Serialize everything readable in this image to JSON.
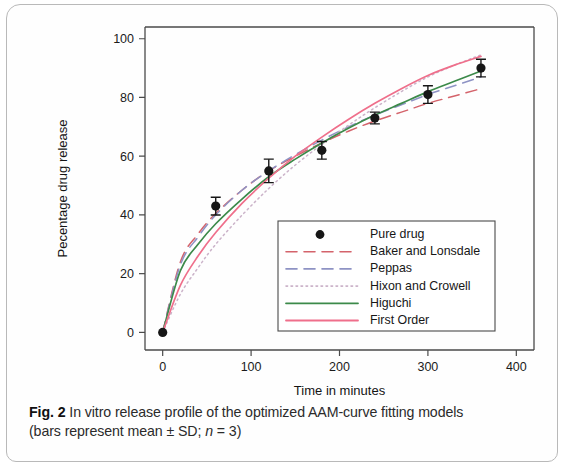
{
  "figure": {
    "caption_label": "Fig. 2",
    "caption_text": " In vitro release profile of the optimized AAM-curve fitting models",
    "caption_line2_a": "(bars represent mean ± SD; ",
    "caption_line2_italic": "n",
    "caption_line2_b": " = 3)"
  },
  "chart_data": {
    "type": "line",
    "title": "",
    "xlabel": "Time in minutes",
    "ylabel": "Pecentage drug release",
    "xlim": [
      -20,
      420
    ],
    "ylim": [
      -6,
      104
    ],
    "xticks": [
      0,
      100,
      200,
      300,
      400
    ],
    "yticks": [
      0,
      20,
      40,
      60,
      80,
      100
    ],
    "xtick_labels": [
      "0",
      "100",
      "200",
      "300",
      "400"
    ],
    "ytick_labels": [
      "0",
      "20",
      "40",
      "60",
      "80",
      "100"
    ],
    "grid": false,
    "legend_position": "lower right",
    "points": {
      "name": "Pure drug",
      "marker": "filled-circle",
      "color": "#161616",
      "x": [
        0,
        60,
        120,
        180,
        240,
        300,
        360
      ],
      "y": [
        0,
        43,
        55,
        62,
        73,
        81,
        90
      ],
      "yerr": [
        0,
        3,
        4,
        3,
        2,
        3,
        3
      ]
    },
    "series": [
      {
        "name": "Baker and Lonsdale",
        "color": "#d4636b",
        "style": "dashed",
        "x": [
          0,
          20,
          40,
          60,
          90,
          120,
          150,
          180,
          210,
          240,
          270,
          300,
          330,
          360
        ],
        "y": [
          0,
          24,
          33.5,
          40.5,
          48.5,
          55,
          60,
          64.5,
          68.5,
          72,
          75,
          78,
          80.5,
          83
        ]
      },
      {
        "name": "Peppas",
        "color": "#8e93c4",
        "style": "dashed",
        "x": [
          0,
          20,
          40,
          60,
          90,
          120,
          150,
          180,
          210,
          240,
          270,
          300,
          330,
          360
        ],
        "y": [
          0,
          23,
          32.5,
          40,
          48.5,
          55,
          60.5,
          65.5,
          70,
          74,
          77.5,
          81,
          84,
          87
        ]
      },
      {
        "name": "Hixon and Crowell",
        "color": "#cbb3c9",
        "style": "dotted",
        "x": [
          0,
          20,
          40,
          60,
          90,
          120,
          150,
          180,
          210,
          240,
          270,
          300,
          330,
          360
        ],
        "y": [
          0,
          13,
          22,
          30,
          40,
          49,
          57,
          64,
          70.5,
          76.5,
          82,
          87,
          91,
          94.5
        ]
      },
      {
        "name": "Higuchi",
        "color": "#3c8a4a",
        "style": "solid",
        "x": [
          0,
          20,
          40,
          60,
          90,
          120,
          150,
          180,
          210,
          240,
          270,
          300,
          330,
          360
        ],
        "y": [
          0,
          21,
          30,
          37,
          45.5,
          53,
          59,
          64.5,
          69.5,
          74,
          78,
          82,
          85.5,
          89
        ]
      },
      {
        "name": "First Order",
        "color": "#ef6f8b",
        "style": "solid",
        "x": [
          0,
          20,
          40,
          60,
          90,
          120,
          150,
          180,
          210,
          240,
          270,
          300,
          330,
          360
        ],
        "y": [
          0,
          16,
          26,
          34,
          44,
          52.5,
          60,
          66.5,
          72.5,
          78,
          83,
          87.5,
          91,
          94
        ]
      }
    ],
    "legend_entries": [
      {
        "label": "Pure drug",
        "kind": "marker",
        "color": "#161616",
        "style": "marker"
      },
      {
        "label": "Baker and Lonsdale",
        "kind": "line",
        "color": "#d4636b",
        "style": "dashed"
      },
      {
        "label": "Peppas",
        "kind": "line",
        "color": "#8e93c4",
        "style": "dashed"
      },
      {
        "label": "Hixon and Crowell",
        "kind": "line",
        "color": "#cbb3c9",
        "style": "dotted"
      },
      {
        "label": "Higuchi",
        "kind": "line",
        "color": "#3c8a4a",
        "style": "solid"
      },
      {
        "label": "First Order",
        "kind": "line",
        "color": "#ef6f8b",
        "style": "solid"
      }
    ]
  }
}
